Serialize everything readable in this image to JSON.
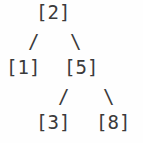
{
  "diagram": {
    "kind": "binary-search-tree",
    "background_color": "#fefefe",
    "text_color": "#3b3b3b",
    "nodes": [
      {
        "id": "root",
        "label": "[2]",
        "value": 2,
        "level": 0,
        "role": "root"
      },
      {
        "id": "left",
        "label": "[1]",
        "value": 1,
        "level": 1,
        "role": "left-child-of-root"
      },
      {
        "id": "right",
        "label": "[5]",
        "value": 5,
        "level": 1,
        "role": "right-child-of-root"
      },
      {
        "id": "right-left",
        "label": "[3]",
        "value": 3,
        "level": 2,
        "role": "left-child-of-5"
      },
      {
        "id": "right-right",
        "label": "[8]",
        "value": 8,
        "level": 2,
        "role": "right-child-of-5"
      }
    ],
    "edges": [
      {
        "id": "root-to-left",
        "glyph": "/",
        "from": "root",
        "to": "left"
      },
      {
        "id": "root-to-right",
        "glyph": "\\",
        "from": "root",
        "to": "right"
      },
      {
        "id": "right-to-left",
        "glyph": "/",
        "from": "right",
        "to": "right-left"
      },
      {
        "id": "right-to-right",
        "glyph": "\\",
        "from": "right",
        "to": "right-right"
      }
    ]
  }
}
